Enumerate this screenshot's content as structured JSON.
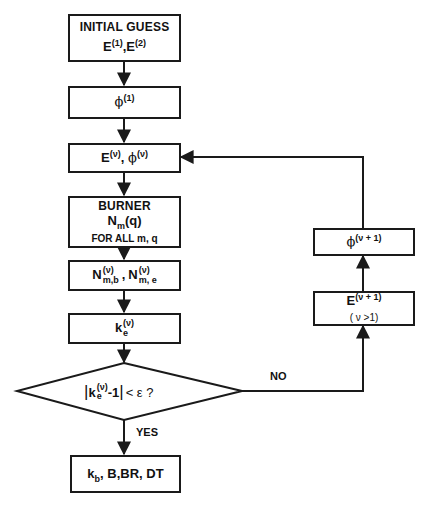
{
  "diagram": {
    "type": "flowchart",
    "nodes": {
      "initial_guess": {
        "title": "INITIAL GUESS",
        "e_base_1": "E",
        "e_sup_1": "(1)",
        "sep": ",",
        "e_base_2": "E",
        "e_sup_2": "(2)"
      },
      "phi_1": {
        "base": "ϕ",
        "sup": "(1)"
      },
      "e_phi_nu": {
        "e_base": "E",
        "e_sup": "(ν)",
        "sep": ",",
        "phi_base": "ϕ",
        "phi_sup": "(ν)"
      },
      "burner": {
        "title": "BURNER",
        "n_base": "N",
        "n_sub": "m",
        "n_arg": "(q)",
        "note": "FOR ALL m, q"
      },
      "n_values": {
        "n1_base": "N",
        "n1_sup": "(ν)",
        "n1_sub": "m,b",
        "sep": ",",
        "n2_base": "N",
        "n2_sup": "(ν)",
        "n2_sub": "m, e"
      },
      "k_e": {
        "base": "k",
        "sub": "e",
        "sup": "(ν)"
      },
      "decision": {
        "abs_open": "|",
        "base": "k",
        "sub": "e",
        "sup": "(ν)",
        "tail": "-1",
        "abs_close": "|",
        "compare": "< ε ?"
      },
      "result": {
        "k_base": "k",
        "k_sub": "b",
        "rest": ", B,BR, DT"
      },
      "phi_next": {
        "base": "ϕ",
        "sup": "(ν + 1)"
      },
      "e_next": {
        "base": "E",
        "sup": "(ν + 1)",
        "condition": "( ν >1)"
      }
    },
    "edge_labels": {
      "yes": "YES",
      "no": "NO"
    },
    "edges": [
      {
        "from": "initial_guess",
        "to": "phi_1"
      },
      {
        "from": "phi_1",
        "to": "e_phi_nu"
      },
      {
        "from": "e_phi_nu",
        "to": "burner"
      },
      {
        "from": "burner",
        "to": "n_values"
      },
      {
        "from": "n_values",
        "to": "k_e"
      },
      {
        "from": "k_e",
        "to": "decision"
      },
      {
        "from": "decision",
        "to": "result",
        "label": "YES"
      },
      {
        "from": "decision",
        "to": "e_next",
        "label": "NO"
      },
      {
        "from": "e_next",
        "to": "phi_next"
      },
      {
        "from": "phi_next",
        "to": "e_phi_nu"
      }
    ],
    "colors": {
      "line": "#1a1a1a",
      "background": "#ffffff"
    }
  }
}
